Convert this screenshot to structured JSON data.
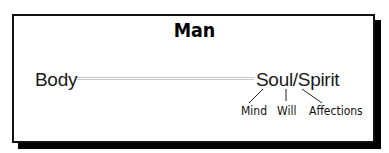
{
  "diagram": {
    "title": "Man",
    "nodes": {
      "body": "Body",
      "soul_spirit": "Soul/Spirit",
      "mind": "Mind",
      "will": "Will",
      "affections": "Affections"
    },
    "edges": [
      {
        "from": "Body",
        "to": "Soul/Spirit",
        "style": "double-line"
      },
      {
        "from": "Soul/Spirit",
        "to": "Mind"
      },
      {
        "from": "Soul/Spirit",
        "to": "Will"
      },
      {
        "from": "Soul/Spirit",
        "to": "Affections"
      }
    ],
    "colors": {
      "border": "#111111",
      "shadow": "#000000",
      "connector": "#bdbdbd",
      "text": "#111111",
      "background": "#ffffff"
    }
  }
}
